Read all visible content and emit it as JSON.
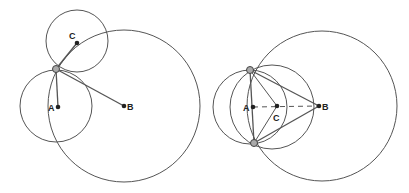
{
  "figures": [
    {
      "name": "left",
      "labels": {
        "A": "A",
        "B": "B",
        "C": "C"
      },
      "points": {
        "A": [
          58,
          107
        ],
        "B": [
          124,
          106
        ],
        "C": [
          77,
          43
        ],
        "P": [
          56,
          69
        ]
      },
      "circles": [
        {
          "center": "C",
          "cx": 77,
          "cy": 41,
          "r": 31
        },
        {
          "center": "A",
          "cx": 56,
          "cy": 106,
          "r": 36
        },
        {
          "center": "B",
          "cx": 124,
          "cy": 106,
          "r": 76
        }
      ]
    },
    {
      "name": "right",
      "labels": {
        "A": "A",
        "B": "B",
        "C": "C"
      },
      "points": {
        "A": [
          253,
          107
        ],
        "B": [
          319,
          106
        ],
        "C": [
          277,
          106
        ],
        "P1": [
          250,
          70
        ],
        "P2": [
          254,
          143
        ]
      },
      "circles": [
        {
          "center": "A",
          "cx": 250,
          "cy": 107,
          "r": 37
        },
        {
          "center": "C",
          "cx": 272,
          "cy": 107,
          "r": 42
        },
        {
          "center": "B",
          "cx": 322,
          "cy": 106,
          "r": 75
        }
      ]
    }
  ],
  "colors": {
    "stroke": "#555555",
    "point": "#222222"
  }
}
